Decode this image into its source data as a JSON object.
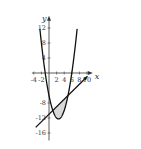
{
  "diagram": {
    "title": "",
    "axes": {
      "x_label": "x",
      "y_label": "y",
      "x_ticks": [
        -4,
        -2,
        2,
        4,
        6,
        8,
        10
      ],
      "y_ticks": [
        12,
        8,
        4,
        -8,
        -12,
        -16
      ],
      "x_tick_labels": [
        "-4",
        "-2",
        "2",
        "4",
        "6",
        "8",
        "10"
      ],
      "y_tick_labels": [
        "12",
        "8",
        "4",
        "-8",
        "-12",
        "-16"
      ],
      "x_range": [
        -4.5,
        11
      ],
      "y_range": [
        -18,
        14
      ]
    },
    "curves": [
      {
        "name": "parabola",
        "equation": "y = x^2 - 5x - 6",
        "x_range": [
          -2.4,
          7.4
        ],
        "color": "#111111"
      },
      {
        "name": "line",
        "equation": "y = x - 11",
        "x_range": [
          -3.5,
          10
        ],
        "color": "#111111",
        "arrow_end": true
      }
    ],
    "shaded_region": {
      "between": [
        "line",
        "parabola"
      ],
      "x_range": [
        1,
        5
      ],
      "fill": "#d9d9d9"
    },
    "intersections": [
      [
        1,
        -10
      ],
      [
        5,
        -6
      ]
    ]
  }
}
